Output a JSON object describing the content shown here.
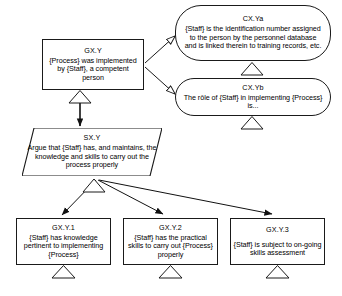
{
  "diagram": {
    "type": "gsn-goal-structuring-notation",
    "nodes": [
      {
        "key": "gxy",
        "kind": "goal",
        "id": "GX.Y",
        "text": "{Process} was implemented by {Staff}, a competent person"
      },
      {
        "key": "cxya",
        "kind": "context",
        "id": "CX.Ya",
        "text": "{Staff} is the identification number assigned to the person by the personnel database and is linked therein to training records, etc."
      },
      {
        "key": "cxyb",
        "kind": "context",
        "id": "CX.Yb",
        "text": "The rôle of {Staff} in implementing {Process} is..."
      },
      {
        "key": "sxy",
        "kind": "strategy",
        "id": "SX.Y",
        "text": "Argue that {Staff} has, and maintains, the knowledge and skills to carry out the process properly"
      },
      {
        "key": "gxy1",
        "kind": "goal",
        "id": "GX.Y.1",
        "text": "{Staff} has knowledge pertinent to implementing {Process}"
      },
      {
        "key": "gxy2",
        "kind": "goal",
        "id": "GX.Y.2",
        "text": "{Staff} has the practical skills to carry out {Process} properly"
      },
      {
        "key": "gxy3",
        "kind": "goal",
        "id": "GX.Y.3",
        "text": "{Staff} is subject to on-going skills assessment"
      }
    ],
    "edges": [
      {
        "from": "gxy",
        "to": "cxya",
        "style": "in-context-of"
      },
      {
        "from": "gxy",
        "to": "cxyb",
        "style": "in-context-of"
      },
      {
        "from": "gxy",
        "to": "sxy",
        "style": "solved-by"
      },
      {
        "from": "sxy",
        "to": "gxy1",
        "style": "solved-by"
      },
      {
        "from": "sxy",
        "to": "gxy2",
        "style": "solved-by"
      },
      {
        "from": "sxy",
        "to": "gxy3",
        "style": "solved-by"
      }
    ],
    "undeveloped_markers": [
      "cxya",
      "cxyb",
      "sxy",
      "gxy1",
      "gxy2",
      "gxy3"
    ],
    "colors": {
      "stroke": "#1a1a1a",
      "fill": "#ffffff",
      "text": "#000000"
    }
  }
}
